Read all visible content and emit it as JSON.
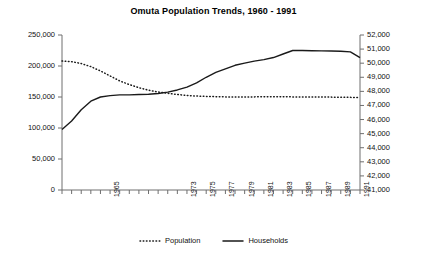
{
  "chart_data": {
    "type": "line",
    "title": "Omuta Population Trends, 1960 - 1991",
    "xlabel": "",
    "ylabel": "",
    "y2label": "",
    "grid": false,
    "legend_position": "bottom",
    "ylim": [
      0,
      250000
    ],
    "y2lim": [
      41000,
      52000
    ],
    "ytick_labels": [
      "250,000",
      "200,000",
      "150,000",
      "100,000",
      "50,000",
      "0"
    ],
    "ytick_values": [
      250000,
      200000,
      150000,
      100000,
      50000,
      0
    ],
    "y2tick_labels": [
      "52,000",
      "51,000",
      "50,000",
      "49,000",
      "48,000",
      "47,000",
      "46,000",
      "45,000",
      "44,000",
      "43,000",
      "42,000",
      "41,000"
    ],
    "y2tick_values": [
      52000,
      51000,
      50000,
      49000,
      48000,
      47000,
      46000,
      45000,
      44000,
      43000,
      42000,
      41000
    ],
    "x": [
      1960,
      1961,
      1962,
      1963,
      1964,
      1965,
      1966,
      1967,
      1968,
      1969,
      1970,
      1971,
      1972,
      1973,
      1974,
      1975,
      1976,
      1977,
      1978,
      1979,
      1980,
      1981,
      1982,
      1983,
      1984,
      1985,
      1986,
      1987,
      1988,
      1989,
      1990,
      1991
    ],
    "xtick_labels": [
      "1965",
      "1973",
      "1975",
      "1977",
      "1979",
      "1981",
      "1983",
      "1985",
      "1987",
      "1989",
      "1991"
    ],
    "xtick_values": [
      1965,
      1973,
      1975,
      1977,
      1979,
      1981,
      1983,
      1985,
      1987,
      1989,
      1991
    ],
    "series": [
      {
        "name": "Population",
        "axis": "left",
        "style": "dotted",
        "color": "#1a1a1a",
        "values": [
          208000,
          207000,
          204000,
          199000,
          192000,
          184000,
          176000,
          170000,
          165000,
          161000,
          158000,
          156000,
          154000,
          152500,
          151500,
          151000,
          150500,
          150200,
          150000,
          150000,
          150200,
          150300,
          150300,
          150300,
          150200,
          150100,
          150000,
          150000,
          149800,
          149600,
          149400,
          149200
        ]
      },
      {
        "name": "Households",
        "axis": "right",
        "style": "solid",
        "color": "#1a1a1a",
        "values": [
          45300,
          45900,
          46700,
          47300,
          47600,
          47700,
          47750,
          47750,
          47780,
          47800,
          47850,
          47950,
          48100,
          48300,
          48600,
          49000,
          49350,
          49600,
          49850,
          50000,
          50150,
          50250,
          50400,
          50650,
          50900,
          50900,
          50880,
          50870,
          50860,
          50850,
          50800,
          50400
        ]
      }
    ]
  },
  "legend": {
    "entries": [
      {
        "label": "Population",
        "key": "dotted-line-key"
      },
      {
        "label": "Households",
        "key": "solid-line-key"
      }
    ]
  },
  "colors": {
    "axis": "#6e6e6e",
    "ink": "#1a1a1a",
    "background": "#ffffff"
  }
}
